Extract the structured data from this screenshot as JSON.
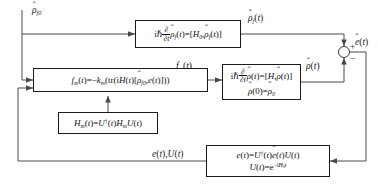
{
  "diagram": {
    "colors": {
      "wire": "#4a4a4a",
      "box_border": "#1a1a1a",
      "text": "#111111",
      "background": "#ffffff"
    }
  },
  "blocks": {
    "free_evolution": {
      "name": "free-evolution-block",
      "equations": [
        "iħ ∂/∂t ρ̂_f(t) = [H₀, ρ̂_f(t)]"
      ]
    },
    "field_law": {
      "name": "control-field-block",
      "equations": [
        "f_m(t) = −k_m(tr(iH(t)[ρ̂_f0, e(t)]))"
      ]
    },
    "controlled_evolution": {
      "name": "controlled-evolution-block",
      "equations": [
        "iħ ∂/∂t ρ̂(t) = [H, ρ̂(t)]",
        "ρ̂(0) = ρ̂₀"
      ]
    },
    "hamiltonian_transform": {
      "name": "hamiltonian-transform-block",
      "equations": [
        "H_m(t) = U†(t) H_m U(t)"
      ]
    },
    "error_transform": {
      "name": "error-transform-block",
      "equations": [
        "e(t) = U†(t) ê(t) U(t)",
        "U(t) = e⁻ⁱᴴ₀ᵗ"
      ]
    }
  },
  "signals": {
    "initial_state": "ρ̂_f0",
    "reference_state": "ρ̂_f(t)",
    "actual_state": "ρ̂(t)",
    "control_field": "f_m(t)",
    "error_hat": "ê(t)",
    "feedback": "e(t),U(t)"
  },
  "summing_junction": {
    "name": "summing-junction",
    "plus": "+",
    "minus": "−",
    "output": "ê(t)"
  }
}
